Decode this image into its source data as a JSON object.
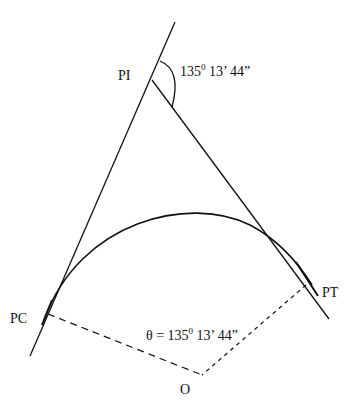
{
  "diagram": {
    "type": "horizontal-curve-geometry",
    "labels": {
      "pi": "PI",
      "pc": "PC",
      "pt": "PT",
      "o": "O"
    },
    "deflection_angle": {
      "deg": "135",
      "deg_mark": "0",
      "rest": " 13’ 44”"
    },
    "central_angle": {
      "prefix": "θ = 135",
      "deg_mark": "0",
      "rest": " 13’ 44”"
    },
    "colors": {
      "line": "#111111",
      "background": "#ffffff"
    }
  }
}
